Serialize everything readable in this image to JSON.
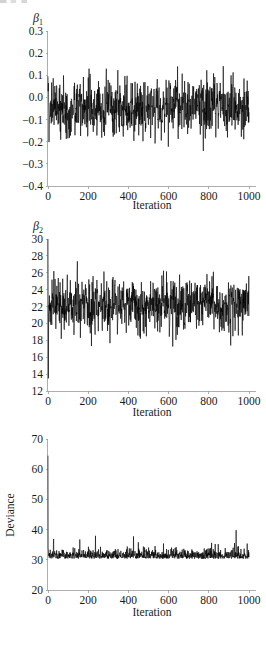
{
  "figure": {
    "kind": "mcmc-trace-panels",
    "background": "#ffffff",
    "trace_color": "#000000",
    "axis_color": "#9a9a9a",
    "text_color": "#1a1a1a"
  },
  "panels": [
    {
      "id": "beta1",
      "series_label": "β",
      "series_subscript": "1",
      "xlabel": "Iteration",
      "ylabel": "",
      "xticks": [
        "0",
        "200",
        "400",
        "600",
        "800",
        "1000"
      ],
      "yticks": [
        "0.3",
        "0.2",
        "0.1",
        "0.0",
        "−0.1",
        "−0.2",
        "−0.3",
        "−0.4"
      ]
    },
    {
      "id": "beta2",
      "series_label": "β",
      "series_subscript": "2",
      "xlabel": "Iteration",
      "ylabel": "",
      "xticks": [
        "0",
        "200",
        "400",
        "600",
        "800",
        "1000"
      ],
      "yticks": [
        "30",
        "28",
        "26",
        "24",
        "22",
        "20",
        "18",
        "16",
        "14",
        "12"
      ]
    },
    {
      "id": "deviance",
      "series_label": "",
      "series_subscript": "",
      "xlabel": "Iteration",
      "ylabel": "Deviance",
      "xticks": [
        "0",
        "200",
        "400",
        "600",
        "800",
        "1000"
      ],
      "yticks": [
        "70",
        "60",
        "50",
        "40",
        "30",
        "20"
      ]
    }
  ],
  "chart_data": [
    {
      "type": "line",
      "title": "",
      "name": "beta1-trace",
      "xlabel": "Iteration",
      "ylabel": "β1",
      "xlim": [
        0,
        1000
      ],
      "ylim": [
        -0.4,
        0.3
      ],
      "xticks": [
        0,
        200,
        400,
        600,
        800,
        1000
      ],
      "yticks": [
        -0.4,
        -0.3,
        -0.2,
        -0.1,
        0.0,
        0.1,
        0.2,
        0.3
      ],
      "grid": false,
      "legend": "none",
      "n_points": 1000,
      "stats": {
        "mean": -0.045,
        "sd": 0.062,
        "min": -0.305,
        "max": 0.205,
        "start": 0.095
      },
      "description": "Dense MCMC trace for regression coefficient beta_1, stationary about -0.045, no visible burn-in trend."
    },
    {
      "type": "line",
      "title": "",
      "name": "beta2-trace",
      "xlabel": "Iteration",
      "ylabel": "β2",
      "xlim": [
        0,
        1000
      ],
      "ylim": [
        12,
        30
      ],
      "xticks": [
        0,
        200,
        400,
        600,
        800,
        1000
      ],
      "yticks": [
        12,
        14,
        16,
        18,
        20,
        22,
        24,
        26,
        28,
        30
      ],
      "grid": false,
      "legend": "none",
      "n_points": 1000,
      "stats": {
        "mean": 22.2,
        "sd": 1.55,
        "min": 13.5,
        "max": 30.0,
        "start": 30.0
      },
      "description": "Dense MCMC trace for regression coefficient beta_2, stationary about 22.2 after an initial excursion from 30 down to 13.5."
    },
    {
      "type": "line",
      "title": "",
      "name": "deviance-trace",
      "xlabel": "Iteration",
      "ylabel": "Deviance",
      "xlim": [
        0,
        1000
      ],
      "ylim": [
        20,
        70
      ],
      "xticks": [
        0,
        200,
        400,
        600,
        800,
        1000
      ],
      "yticks": [
        20,
        30,
        40,
        50,
        60,
        70
      ],
      "grid": false,
      "legend": "none",
      "n_points": 1000,
      "stats": {
        "mean": 32.0,
        "sd": 1.9,
        "min": 29.8,
        "max": 64.5,
        "start": 64.5
      },
      "description": "Dense MCMC deviance trace with a single tall burn-in spike to 64.5 at iteration 0, then a right-skewed stationary band just above 30."
    }
  ]
}
